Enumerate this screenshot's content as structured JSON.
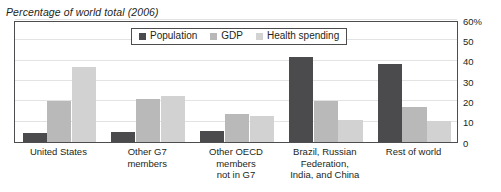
{
  "chart_data": {
    "type": "bar",
    "title": "Percentage of world total (2006)",
    "xlabel": "",
    "ylabel": "",
    "ylim": [
      0,
      60
    ],
    "ytick_labels": [
      "60%",
      "50",
      "40",
      "30",
      "20",
      "10",
      "0"
    ],
    "yticks": [
      60,
      50,
      40,
      30,
      20,
      10,
      0
    ],
    "grid": true,
    "legend_position": "top-center",
    "categories": [
      "United States",
      "Other G7 members",
      "Other OECD members not in G7",
      "Brazil, Russian Federation, India, and China",
      "Rest of world"
    ],
    "category_lines": [
      [
        "United States"
      ],
      [
        "Other G7",
        "members"
      ],
      [
        "Other OECD",
        "members",
        "not in G7"
      ],
      [
        "Brazil, Russian",
        "Federation,",
        "India, and China"
      ],
      [
        "Rest of world"
      ]
    ],
    "series": [
      {
        "name": "Population",
        "color": "#4b4b4d",
        "values": [
          4.5,
          5.0,
          5.5,
          42.0,
          38.5
        ]
      },
      {
        "name": "GDP",
        "color": "#b9b9b9",
        "values": [
          20.0,
          21.0,
          14.0,
          20.0,
          17.0
        ]
      },
      {
        "name": "Health spending",
        "color": "#d2d2d2",
        "values": [
          37.0,
          22.5,
          13.0,
          11.0,
          10.5
        ]
      }
    ]
  },
  "legend": {
    "items": [
      {
        "label": "Population"
      },
      {
        "label": "GDP"
      },
      {
        "label": "Health spending"
      }
    ]
  }
}
